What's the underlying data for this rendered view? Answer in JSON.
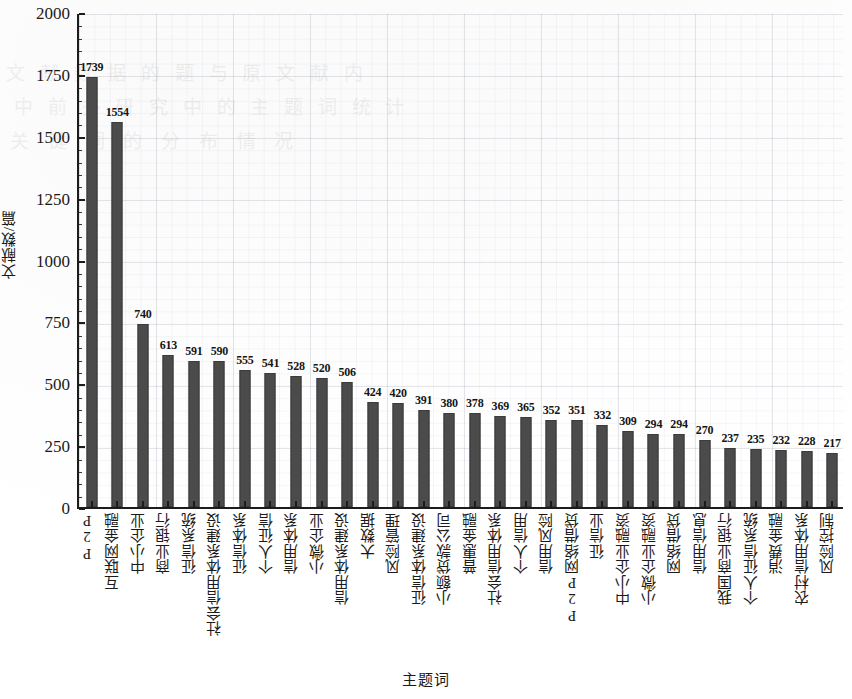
{
  "chart_data": {
    "type": "bar",
    "title": "",
    "xlabel": "主题词",
    "ylabel": "文献数/篇",
    "ylim": [
      0,
      2000
    ],
    "yticks": [
      0,
      250,
      500,
      750,
      1000,
      1250,
      1500,
      1750,
      2000
    ],
    "grid": true,
    "legend": null,
    "bar_color": "#4b4b4b",
    "categories": [
      "P2P",
      "互联网金融",
      "中小企业",
      "商业银行",
      "征信系统",
      "社会信用体系建设",
      "征信体系",
      "个人征信",
      "信用体系",
      "小微企业",
      "信用体系建设",
      "大数据",
      "风险管理",
      "征信体系建设",
      "小额贷款公司",
      "普惠金融",
      "社会信用体系",
      "个人信用",
      "信用风险",
      "P2P网络借贷",
      "征信业",
      "中小企业融资",
      "小微企业融资",
      "网络借贷",
      "信用信息",
      "我国商业银行",
      "个人征信系统",
      "消费金融",
      "农村信用体系",
      "风险控制"
    ],
    "values": [
      1739,
      1554,
      740,
      613,
      591,
      590,
      555,
      541,
      528,
      520,
      506,
      424,
      420,
      391,
      380,
      378,
      369,
      365,
      352,
      351,
      332,
      309,
      294,
      294,
      270,
      237,
      235,
      232,
      228,
      217
    ]
  },
  "ghost_text": {
    "line1": "文 献 数 据 的 题 与 原 文 献 内",
    "line2": "中 前 多 研 究 中 的 主 题 词 统 计",
    "line3": "关 键 词 的 分 布 情 况"
  }
}
